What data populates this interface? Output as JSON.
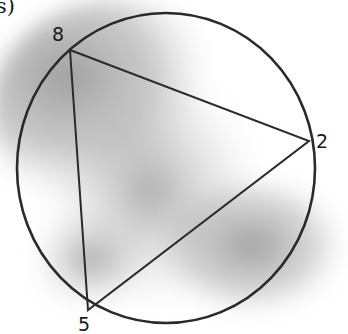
{
  "part_label": "s)",
  "figure": {
    "type": "inscribed-triangle-in-circle",
    "circle": {
      "cx": 166,
      "cy": 168,
      "rx": 149,
      "ry": 155
    },
    "vertices": [
      {
        "label": "8",
        "x": 70,
        "y": 50,
        "label_x": 52,
        "label_y": 25
      },
      {
        "label": "2",
        "x": 309,
        "y": 141,
        "label_x": 316,
        "label_y": 132
      },
      {
        "label": "5",
        "x": 88,
        "y": 310,
        "label_x": 78,
        "label_y": 315
      }
    ],
    "stroke_color": "#2a2a2a",
    "shading_color": "#9a9a9a"
  }
}
